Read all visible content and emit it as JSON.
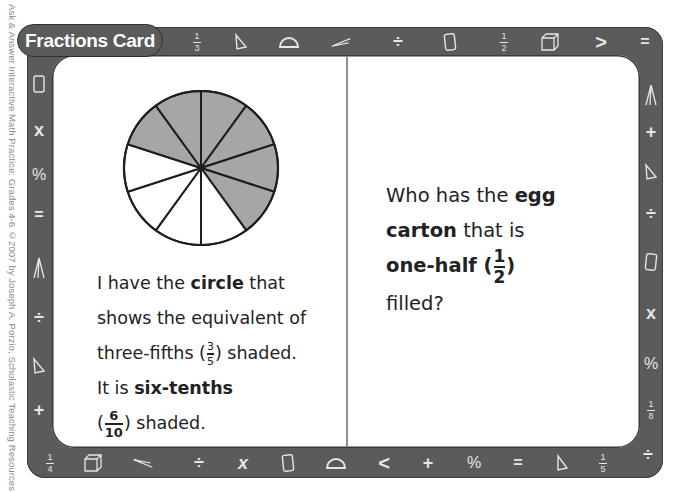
{
  "copyright": "Ask & Answer Interactive Math Practice: Grades 4-6 ©2007 by Joseph A. Porzio, Scholastic Teaching Resources",
  "title": "Fractions Card",
  "colors": {
    "frame": "#5b5b5b",
    "frame_icons": "#e6e6e6",
    "shaded_slice": "#a6a6a6",
    "panel": "#ffffff",
    "text": "#222222"
  },
  "frame_icons": {
    "top": [
      "fraction-1-3",
      "triangle",
      "protractor",
      "compass",
      "divide",
      "tablet",
      "fraction-1-2",
      "cube",
      "greater-than",
      "equals"
    ],
    "right": [
      "compass",
      "plus",
      "triangle",
      "divide",
      "tablet",
      "times",
      "percent",
      "fraction-1-8",
      "divide"
    ],
    "bottom": [
      "fraction-1-4",
      "cube",
      "compass",
      "divide",
      "times",
      "tablet",
      "protractor",
      "less-than",
      "plus",
      "percent",
      "equals",
      "triangle",
      "fraction-1-5"
    ],
    "left": [
      "tablet",
      "times",
      "percent",
      "equals",
      "compass",
      "divide",
      "triangle",
      "plus"
    ]
  },
  "fractions": {
    "one_third": {
      "n": "1",
      "d": "3"
    },
    "one_half": {
      "n": "1",
      "d": "2"
    },
    "one_eighth": {
      "n": "1",
      "d": "8"
    },
    "one_fourth": {
      "n": "1",
      "d": "4"
    },
    "one_fifth": {
      "n": "1",
      "d": "5"
    }
  },
  "symbols": {
    "divide": "÷",
    "times": "x",
    "percent": "%",
    "equals": "=",
    "plus": "+",
    "greater": ">",
    "less": "<"
  },
  "circle": {
    "total_slices": 10,
    "shaded_slices": 6
  },
  "left_card": {
    "line1_a": "I have the ",
    "line1_b": "circle",
    "line1_c": " that",
    "line2": "shows the equivalent of",
    "line3_a": "three-fifths (",
    "line3_frac_n": "3",
    "line3_frac_d": "5",
    "line3_b": ") shaded.",
    "line4_a": "It is ",
    "line4_b": "six-tenths",
    "line5_a": "(",
    "line5_frac_n": "6",
    "line5_frac_d": "10",
    "line5_b": ") shaded."
  },
  "right_card": {
    "line1_a": "Who has the ",
    "line1_b": "egg",
    "line2_a": "carton",
    "line2_b": " that is",
    "line3_a": "one-half (",
    "line3_frac_n": "1",
    "line3_frac_d": "2",
    "line3_b": ")",
    "line4": "filled?"
  }
}
